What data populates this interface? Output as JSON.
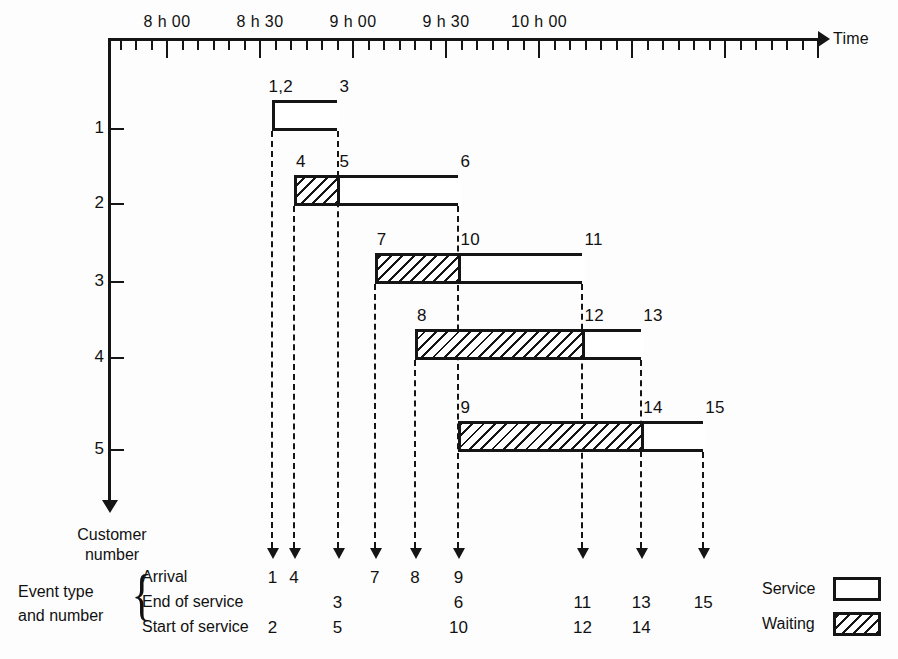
{
  "chart_data": {
    "type": "bar",
    "title": "",
    "xlabel": "Time",
    "ylabel": "Customer number",
    "grid": false,
    "legend_position": "bottom-right",
    "x_axis": {
      "label": "Time",
      "major_ticks": [
        {
          "value": 480,
          "label": "8 h 00"
        },
        {
          "value": 510,
          "label": "8 h 30"
        },
        {
          "value": 540,
          "label": "9 h 00"
        },
        {
          "value": 570,
          "label": "9 h 30"
        },
        {
          "value": 600,
          "label": "10 h 00"
        }
      ],
      "minor_tick_interval_minutes": 5,
      "range_minutes": [
        465,
        692
      ]
    },
    "y_axis": {
      "label": "Customer number",
      "categories": [
        "1",
        "2",
        "3",
        "4",
        "5"
      ]
    },
    "series": [
      {
        "name": "Service",
        "color": "#ffffff",
        "pattern": "solid"
      },
      {
        "name": "Waiting",
        "color": "#ffffff",
        "pattern": "hatched"
      }
    ],
    "bars": [
      {
        "customer": "1",
        "waiting": null,
        "service": {
          "start": 514,
          "end": 535
        },
        "labels_above": [
          {
            "text": "1,2",
            "at": 514
          },
          {
            "text": "3",
            "at": 535
          }
        ]
      },
      {
        "customer": "2",
        "waiting": {
          "start": 521,
          "end": 535
        },
        "service": {
          "start": 535,
          "end": 574
        },
        "labels_above": [
          {
            "text": "4",
            "at": 521
          },
          {
            "text": "5",
            "at": 535
          },
          {
            "text": "6",
            "at": 574
          }
        ]
      },
      {
        "customer": "3",
        "waiting": {
          "start": 547,
          "end": 574
        },
        "service": {
          "start": 574,
          "end": 614
        },
        "labels_above": [
          {
            "text": "7",
            "at": 547
          },
          {
            "text": "10",
            "at": 574
          },
          {
            "text": "11",
            "at": 614
          }
        ]
      },
      {
        "customer": "4",
        "waiting": {
          "start": 560,
          "end": 614
        },
        "service": {
          "start": 614,
          "end": 633
        },
        "labels_above": [
          {
            "text": "8",
            "at": 560
          },
          {
            "text": "12",
            "at": 614
          },
          {
            "text": "13",
            "at": 633
          }
        ]
      },
      {
        "customer": "5",
        "waiting": {
          "start": 574,
          "end": 633
        },
        "service": {
          "start": 633,
          "end": 653
        },
        "labels_above": [
          {
            "text": "9",
            "at": 574
          },
          {
            "text": "14",
            "at": 633
          },
          {
            "text": "15",
            "at": 653
          }
        ]
      }
    ],
    "event_table": {
      "row_labels": [
        "Arrival",
        "End of service",
        "Start of service"
      ],
      "columns": [
        {
          "time": 514,
          "arrival": "1",
          "end_of_service": "",
          "start_of_service": "2"
        },
        {
          "time": 521,
          "arrival": "4",
          "end_of_service": "",
          "start_of_service": ""
        },
        {
          "time": 535,
          "arrival": "",
          "end_of_service": "3",
          "start_of_service": "5"
        },
        {
          "time": 547,
          "arrival": "7",
          "end_of_service": "",
          "start_of_service": ""
        },
        {
          "time": 560,
          "arrival": "8",
          "end_of_service": "",
          "start_of_service": ""
        },
        {
          "time": 574,
          "arrival": "9",
          "end_of_service": "6",
          "start_of_service": "10"
        },
        {
          "time": 614,
          "arrival": "",
          "end_of_service": "11",
          "start_of_service": "12"
        },
        {
          "time": 633,
          "arrival": "",
          "end_of_service": "13",
          "start_of_service": "14"
        },
        {
          "time": 653,
          "arrival": "",
          "end_of_service": "15",
          "start_of_service": ""
        }
      ]
    }
  },
  "axis": {
    "time_label": "Time",
    "tick_labels": [
      "8 h 00",
      "8 h 30",
      "9 h 00",
      "9 h 30",
      "10 h 00"
    ],
    "customer_ticks": [
      "1",
      "2",
      "3",
      "4",
      "5"
    ]
  },
  "captions": {
    "customer_line1": "Customer",
    "customer_line2": "number",
    "event_line1": "Event type",
    "event_line2": "and number",
    "row_arrival": "Arrival",
    "row_end_of_service": "End of service",
    "row_start_of_service": "Start of service"
  },
  "legend": {
    "service_label": "Service",
    "waiting_label": "Waiting"
  },
  "bar_labels": {
    "c1": [
      "1,2",
      "3"
    ],
    "c2": [
      "4",
      "5",
      "6"
    ],
    "c3": [
      "7",
      "10",
      "11"
    ],
    "c4": [
      "8",
      "12",
      "13"
    ],
    "c5": [
      "9",
      "14",
      "15"
    ]
  },
  "event_numbers": {
    "arrival": [
      "1",
      "4",
      "7",
      "8",
      "9"
    ],
    "end_of_service": [
      "3",
      "6",
      "11",
      "13",
      "15"
    ],
    "start_of_service": [
      "2",
      "5",
      "10",
      "12",
      "14"
    ]
  },
  "colors": {
    "ink": "#151515",
    "paper": "#ffffff"
  }
}
